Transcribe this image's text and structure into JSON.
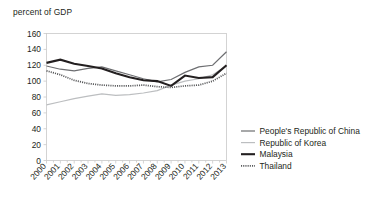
{
  "chart_data": {
    "type": "line",
    "title": "",
    "ylabel": "percent of GDP",
    "xlabel": "",
    "ylim": [
      0,
      160
    ],
    "ytick_step": 20,
    "yticks": [
      "0",
      "20",
      "40",
      "60",
      "80",
      "100",
      "120",
      "140",
      "160"
    ],
    "grid": false,
    "legend_position": "bottom-right",
    "categories": [
      "2000",
      "2001",
      "2002",
      "2003",
      "2004",
      "2005",
      "2006",
      "2007",
      "2008",
      "2009",
      "2010",
      "2011",
      "2012",
      "2013"
    ],
    "series": [
      {
        "name": "People's Republic of China",
        "color": "#6d6e71",
        "style": "solid-thin",
        "width": 1.2,
        "values": [
          119,
          115,
          113,
          116,
          118,
          113,
          108,
          103,
          99,
          102,
          111,
          118,
          120,
          137
        ]
      },
      {
        "name": "Republic of Korea",
        "color": "#bcbec0",
        "style": "solid-thin",
        "width": 1.2,
        "values": [
          70,
          74,
          78,
          81,
          84,
          82,
          83,
          85,
          88,
          95,
          100,
          103,
          108,
          119
        ]
      },
      {
        "name": "Malaysia",
        "color": "#231f20",
        "style": "solid-thick",
        "width": 2.1,
        "values": [
          123,
          127,
          122,
          119,
          116,
          110,
          105,
          101,
          100,
          94,
          107,
          104,
          105,
          120
        ]
      },
      {
        "name": "Thailand",
        "color": "#58595b",
        "style": "dotted",
        "width": 1.7,
        "values": [
          113,
          108,
          101,
          97,
          95,
          94,
          94,
          95,
          93,
          92,
          94,
          95,
          100,
          110
        ]
      }
    ]
  },
  "legend": {
    "items": [
      {
        "label": "People's Republic of China"
      },
      {
        "label": "Republic of Korea"
      },
      {
        "label": "Malaysia"
      },
      {
        "label": "Thailand"
      }
    ]
  }
}
